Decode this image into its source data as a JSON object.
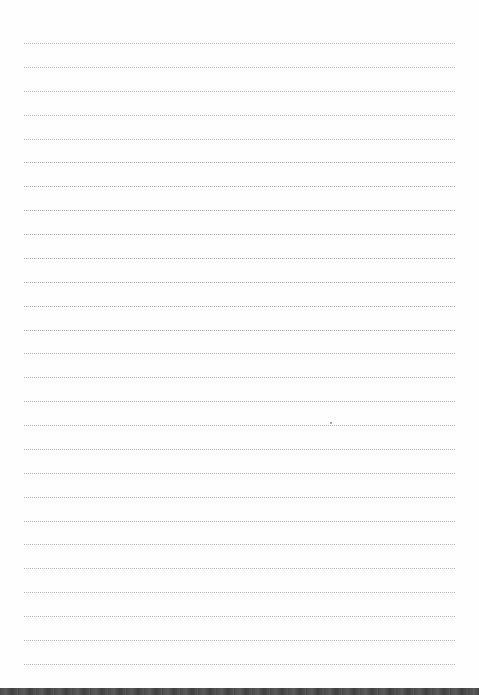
{
  "document": {
    "type": "ruled-notebook-page",
    "line_count": 27,
    "first_line_y": 43,
    "line_spacing": 23.88,
    "line_left": 24,
    "line_right": 455,
    "line_style": "dotted",
    "line_color": "#b9b9b9",
    "paper_color": "#fefefe",
    "bottom_edge_color": "#4a4a4a",
    "marks": [
      {
        "x": 330,
        "y": 422
      }
    ]
  }
}
